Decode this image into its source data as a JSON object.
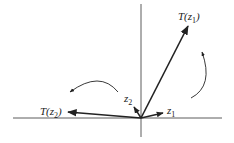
{
  "diagram": {
    "type": "vector-transformation",
    "axes": {
      "horizontal": true,
      "vertical": true
    },
    "vectors": [
      {
        "name": "z1",
        "label": "z",
        "sub": "1"
      },
      {
        "name": "z2",
        "label": "z",
        "sub": "2"
      },
      {
        "name": "T(z1)",
        "label": "T(z",
        "sub": "1",
        "suffix": ")"
      },
      {
        "name": "T(z2)",
        "label": "T(z",
        "sub": "2",
        "suffix": ")"
      }
    ],
    "rotation_arrows": [
      "counterclockwise-right",
      "counterclockwise-left"
    ]
  },
  "colors": {
    "stroke": "#222222",
    "axis": "#333333",
    "background": "#ffffff"
  }
}
